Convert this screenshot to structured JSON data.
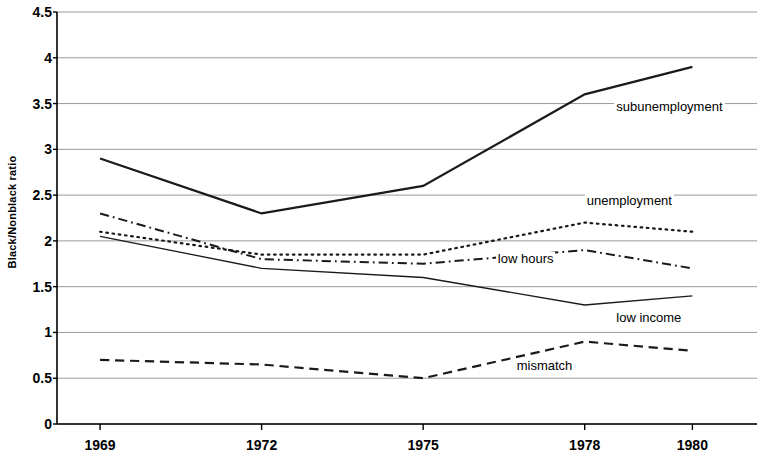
{
  "chart_data": {
    "type": "line",
    "title": "",
    "xlabel": "",
    "ylabel": "Black/Nonblack ratio",
    "x": [
      1969,
      1972,
      1975,
      1978,
      1980
    ],
    "xtick_labels": [
      "1969",
      "1972",
      "1975",
      "1978",
      "1980"
    ],
    "ytick_labels": [
      "0",
      "0.5",
      "1",
      "1.5",
      "2",
      "2.5",
      "3",
      "3.5",
      "4",
      "4.5"
    ],
    "ytick_values": [
      0,
      0.5,
      1,
      1.5,
      2,
      2.5,
      3,
      3.5,
      4,
      4.5
    ],
    "ylim": [
      0,
      4.5
    ],
    "xlim": [
      1968.2,
      1981.2
    ],
    "grid": true,
    "grid_axis": "y",
    "legend_position": "inline-annotations",
    "line_color": "#1a1a1a",
    "grid_color": "#9a9a9a",
    "axis_color": "#000000",
    "series": [
      {
        "name": "subunemployment",
        "label": "subunemployment",
        "style": "solid",
        "width": 2.2,
        "values": [
          2.9,
          2.3,
          2.6,
          3.6,
          3.9
        ],
        "label_x": 1978.55,
        "label_y": 3.45
      },
      {
        "name": "unemployment",
        "label": "unemployment",
        "style": "dotted",
        "width": 2.2,
        "values": [
          2.1,
          1.85,
          1.85,
          2.2,
          2.1
        ],
        "label_x": 1978.0,
        "label_y": 2.43
      },
      {
        "name": "low hours",
        "label": "low hours",
        "style": "dashdot",
        "width": 2.0,
        "values": [
          2.3,
          1.8,
          1.75,
          1.9,
          1.7
        ],
        "label_x": 1976.35,
        "label_y": 1.79
      },
      {
        "name": "low income",
        "label": "low income",
        "style": "solid-thin",
        "width": 1.3,
        "values": [
          2.05,
          1.7,
          1.6,
          1.3,
          1.4
        ],
        "label_x": 1978.55,
        "label_y": 1.15
      },
      {
        "name": "mismatch",
        "label": "mismatch",
        "style": "dashed",
        "width": 2.2,
        "values": [
          0.7,
          0.65,
          0.5,
          0.9,
          0.8
        ],
        "label_x": 1976.7,
        "label_y": 0.62
      }
    ]
  }
}
